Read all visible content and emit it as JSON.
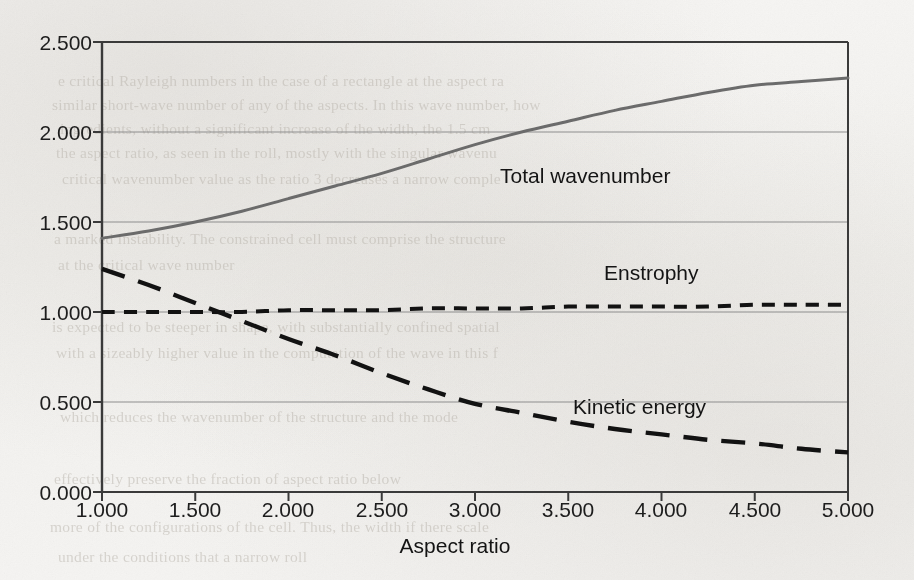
{
  "figure": {
    "background_color": "#f4f3f1",
    "ink_color": "#1d1d1d",
    "axis_color": "#3a3a3a",
    "grid_color": "#8d8d8d",
    "wavenumber_color": "#6b6b6b",
    "dash_color": "#121212"
  },
  "axes": {
    "x_title": "Aspect ratio",
    "y_title": "",
    "x_ticks": [
      "1.000",
      "1.500",
      "2.000",
      "2.500",
      "3.000",
      "3.500",
      "4.000",
      "4.500",
      "5.000"
    ],
    "y_ticks": [
      "0.000",
      "0.500",
      "1.000",
      "1.500",
      "2.000",
      "2.500"
    ]
  },
  "labels": {
    "total_wavenumber": "Total wavenumber",
    "enstrophy": "Enstrophy",
    "kinetic_energy": "Kinetic energy"
  },
  "chart_data": {
    "type": "line",
    "title": "",
    "xlabel": "Aspect ratio",
    "ylabel": "",
    "xlim": [
      1.0,
      5.0
    ],
    "ylim": [
      0.0,
      2.5
    ],
    "xticks": [
      1.0,
      1.5,
      2.0,
      2.5,
      3.0,
      3.5,
      4.0,
      4.5,
      5.0
    ],
    "yticks": [
      0.0,
      0.5,
      1.0,
      1.5,
      2.0,
      2.5
    ],
    "grid": "horizontal",
    "legend": "inline-annotations",
    "x": [
      1.0,
      1.25,
      1.5,
      1.75,
      2.0,
      2.25,
      2.5,
      2.75,
      3.0,
      3.25,
      3.5,
      3.75,
      4.0,
      4.25,
      4.5,
      4.75,
      5.0
    ],
    "series": [
      {
        "name": "Total wavenumber",
        "style": "solid",
        "color": "#6b6b6b",
        "values": [
          1.41,
          1.45,
          1.5,
          1.56,
          1.63,
          1.7,
          1.77,
          1.85,
          1.93,
          2.0,
          2.06,
          2.12,
          2.17,
          2.22,
          2.26,
          2.28,
          2.3
        ]
      },
      {
        "name": "Enstrophy",
        "style": "short-dash",
        "color": "#121212",
        "values": [
          1.0,
          1.0,
          1.0,
          1.0,
          1.01,
          1.01,
          1.01,
          1.02,
          1.02,
          1.02,
          1.03,
          1.03,
          1.03,
          1.03,
          1.04,
          1.04,
          1.04
        ]
      },
      {
        "name": "Kinetic energy",
        "style": "long-dash",
        "color": "#121212",
        "values": [
          1.24,
          1.15,
          1.05,
          0.95,
          0.85,
          0.76,
          0.66,
          0.57,
          0.49,
          0.44,
          0.39,
          0.35,
          0.32,
          0.29,
          0.27,
          0.24,
          0.22
        ]
      }
    ],
    "annotations": [
      {
        "text": "Total wavenumber",
        "x": 3.15,
        "y": 1.79
      },
      {
        "text": "Enstrophy",
        "x": 3.75,
        "y": 1.27
      },
      {
        "text": "Kinetic energy",
        "x": 3.55,
        "y": 0.49
      }
    ]
  },
  "ghost_text": {
    "lines": [
      {
        "t": "e critical Rayleigh numbers in the case of a rectangle at the aspect ra",
        "x": 58,
        "y": 72
      },
      {
        "t": "similar short-wave number of any of the aspects. In this wave number, how",
        "x": 52,
        "y": 96
      },
      {
        "t": "ingredients, without a significant increase of the width, the 1.5 cm",
        "x": 60,
        "y": 120
      },
      {
        "t": "the aspect ratio, as seen in the roll, mostly with the singular wavenu",
        "x": 56,
        "y": 144
      },
      {
        "t": "critical wavenumber value as the ratio 3 decreases a narrow comple",
        "x": 62,
        "y": 170
      },
      {
        "t": "a marked instability. The constrained cell must comprise the structure",
        "x": 54,
        "y": 230
      },
      {
        "t": "at the critical wave number",
        "x": 58,
        "y": 256
      },
      {
        "t": "is expected to be steeper in shape, with substantially confined spatial",
        "x": 52,
        "y": 318
      },
      {
        "t": "with a sizeably higher value in the computation of the wave in this f",
        "x": 56,
        "y": 344
      },
      {
        "t": "which reduces the wavenumber of the structure and the mode",
        "x": 60,
        "y": 408
      },
      {
        "t": "effectively preserve the fraction of aspect ratio below",
        "x": 54,
        "y": 470
      },
      {
        "t": "more of the configurations of the cell. Thus, the width if there scale",
        "x": 50,
        "y": 518
      },
      {
        "t": "under the conditions that a narrow roll",
        "x": 58,
        "y": 548
      }
    ]
  }
}
